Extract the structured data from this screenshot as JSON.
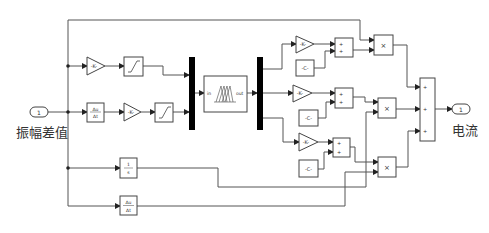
{
  "diagram": {
    "type": "simulink-block-diagram",
    "inport": {
      "number": "1",
      "label": "振幅差值"
    },
    "outport": {
      "number": "1",
      "label": "电流"
    },
    "blocks": {
      "gain_top": {
        "text": "-K-"
      },
      "saturation_top": {
        "text": ""
      },
      "derivative_mid": {
        "num": "Δu",
        "den": "Δt"
      },
      "gain_mid": {
        "text": "-K-"
      },
      "saturation_mid": {
        "text": ""
      },
      "mux": {
        "text": ""
      },
      "fuzzy_controller": {
        "in_label": "in",
        "out_label": "out"
      },
      "demux": {
        "text": ""
      },
      "gain_k1": {
        "text": "-K-"
      },
      "const_c1": {
        "text": "-C-"
      },
      "sum1": {
        "signs": [
          "+",
          "+"
        ]
      },
      "product1": {
        "text": "×"
      },
      "gain_k2": {
        "text": "-K-"
      },
      "const_c2": {
        "text": "-C-"
      },
      "sum2": {
        "signs": [
          "+",
          "+"
        ]
      },
      "product2": {
        "text": "×"
      },
      "gain_k3": {
        "text": "-K-"
      },
      "const_c3": {
        "text": "-C-"
      },
      "sum3": {
        "signs": [
          "+",
          "+"
        ]
      },
      "product3": {
        "text": "×"
      },
      "integrator": {
        "num": "1",
        "den": "s"
      },
      "derivative_bottom": {
        "num": "Δu",
        "den": "Δt"
      },
      "sum_out": {
        "signs": [
          "+",
          "+",
          "+"
        ]
      }
    }
  }
}
